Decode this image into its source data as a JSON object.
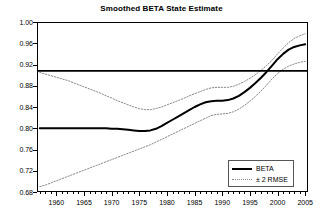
{
  "chart_data": {
    "type": "line",
    "title": "Smoothed BETA State Estimate",
    "xlabel": "",
    "ylabel": "",
    "xlim": [
      1956.5,
      2005.5
    ],
    "ylim": [
      0.68,
      1.0
    ],
    "grid": false,
    "legend_position": "bottom-right",
    "y_ticks": [
      "1.00",
      "0.96",
      "0.92",
      "0.88",
      "0.84",
      "0.80",
      "0.76",
      "0.72",
      "0.68"
    ],
    "y_tick_values": [
      1.0,
      0.96,
      0.92,
      0.88,
      0.84,
      0.8,
      0.76,
      0.72,
      0.68
    ],
    "x_ticks": [
      "1960",
      "1965",
      "1970",
      "1975",
      "1980",
      "1985",
      "1990",
      "1995",
      "2000",
      "2005"
    ],
    "x_tick_values": [
      1960,
      1965,
      1970,
      1975,
      1980,
      1985,
      1990,
      1995,
      2000,
      2005
    ],
    "x_minor_step": 1,
    "reference_line": {
      "name": "unit-beta-reference",
      "value": 0.908,
      "orientation": "horizontal",
      "color": "#000000"
    },
    "x": [
      1957,
      1958,
      1959,
      1960,
      1961,
      1962,
      1963,
      1964,
      1965,
      1966,
      1967,
      1968,
      1969,
      1970,
      1971,
      1972,
      1973,
      1974,
      1975,
      1976,
      1977,
      1978,
      1979,
      1980,
      1981,
      1982,
      1983,
      1984,
      1985,
      1986,
      1987,
      1988,
      1989,
      1990,
      1991,
      1992,
      1993,
      1994,
      1995,
      1996,
      1997,
      1998,
      1999,
      2000,
      2001,
      2002,
      2003,
      2004,
      2005
    ],
    "series": [
      {
        "name": "BETA",
        "style": "solid",
        "width": 2,
        "color": "#000000",
        "values": [
          0.8,
          0.8,
          0.8,
          0.8,
          0.8,
          0.8,
          0.8,
          0.8,
          0.8,
          0.8,
          0.8,
          0.8,
          0.8,
          0.799,
          0.799,
          0.798,
          0.797,
          0.796,
          0.795,
          0.795,
          0.796,
          0.799,
          0.804,
          0.81,
          0.816,
          0.822,
          0.828,
          0.834,
          0.84,
          0.845,
          0.849,
          0.851,
          0.852,
          0.852,
          0.853,
          0.856,
          0.861,
          0.868,
          0.876,
          0.885,
          0.895,
          0.906,
          0.918,
          0.93,
          0.94,
          0.948,
          0.953,
          0.956,
          0.958
        ]
      },
      {
        "name": "+ 2 RMSE",
        "style": "dotted",
        "width": 1,
        "color": "#8a8a8a",
        "values": [
          0.905,
          0.902,
          0.899,
          0.896,
          0.893,
          0.89,
          0.886,
          0.882,
          0.878,
          0.874,
          0.87,
          0.866,
          0.861,
          0.857,
          0.852,
          0.848,
          0.844,
          0.84,
          0.837,
          0.835,
          0.835,
          0.837,
          0.84,
          0.844,
          0.848,
          0.852,
          0.856,
          0.861,
          0.865,
          0.869,
          0.873,
          0.876,
          0.877,
          0.877,
          0.877,
          0.879,
          0.883,
          0.888,
          0.894,
          0.901,
          0.909,
          0.918,
          0.928,
          0.94,
          0.951,
          0.961,
          0.969,
          0.974,
          0.978
        ]
      },
      {
        "name": "- 2 RMSE",
        "style": "dotted",
        "width": 1,
        "color": "#8a8a8a",
        "values": [
          0.69,
          0.693,
          0.697,
          0.701,
          0.705,
          0.709,
          0.713,
          0.717,
          0.721,
          0.725,
          0.729,
          0.733,
          0.737,
          0.741,
          0.745,
          0.749,
          0.753,
          0.757,
          0.761,
          0.765,
          0.769,
          0.774,
          0.779,
          0.784,
          0.789,
          0.794,
          0.799,
          0.804,
          0.809,
          0.814,
          0.819,
          0.824,
          0.826,
          0.827,
          0.828,
          0.831,
          0.836,
          0.843,
          0.851,
          0.86,
          0.87,
          0.881,
          0.893,
          0.903,
          0.911,
          0.917,
          0.921,
          0.924,
          0.926
        ]
      }
    ],
    "legend": [
      {
        "label": "BETA",
        "style": "solid"
      },
      {
        "label": "± 2 RMSE",
        "style": "dotted"
      }
    ]
  }
}
